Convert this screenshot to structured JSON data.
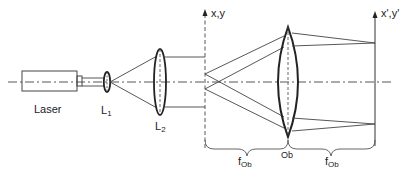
{
  "diagram": {
    "type": "optical-setup",
    "colors": {
      "line": "#333333",
      "text": "#222222",
      "background": "#ffffff"
    },
    "labels": {
      "laser": "Laser",
      "lens1": {
        "main": "L",
        "sub": "1"
      },
      "lens2": {
        "main": "L",
        "sub": "2"
      },
      "focal_plane": "x,y",
      "image_plane": "x',y'",
      "objective": "Ob",
      "focal_left": {
        "main": "f",
        "sub": "Ob"
      },
      "focal_right": {
        "main": "f",
        "sub": "Ob"
      }
    },
    "components": [
      "Laser",
      "L1",
      "L2",
      "Focal plane x,y",
      "Objective Ob",
      "Image plane x',y'"
    ]
  }
}
